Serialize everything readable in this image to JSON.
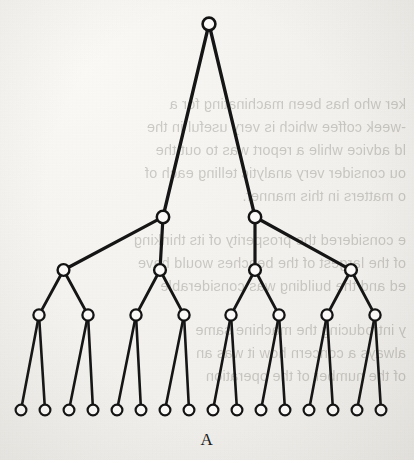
{
  "figure": {
    "caption": "A",
    "kind": "complete-binary-tree",
    "depth": 4,
    "node_counts_per_level": [
      1,
      2,
      4,
      8,
      16
    ],
    "total_nodes": 31,
    "total_edges": 30,
    "node_fill_color": "#fbfaf8",
    "node_stroke_color": "#141414",
    "edge_color": "#161616",
    "background_color": "#f3f2ef"
  },
  "geometry": {
    "width": 414,
    "height": 460,
    "levels": [
      {
        "level": 0,
        "y": 24,
        "radius": 6.4,
        "x": [
          209
        ]
      },
      {
        "level": 1,
        "y": 217,
        "radius": 6.2,
        "x": [
          163,
          255
        ]
      },
      {
        "level": 2,
        "y": 315,
        "radius": 5.6,
        "x": [
          39,
          88,
          136,
          184,
          231,
          279,
          327,
          375
        ]
      },
      {
        "level": 3,
        "y": 315,
        "radius": 5.6,
        "x": []
      },
      {
        "level": 4,
        "y": 410,
        "radius": 5.4,
        "x": [
          21,
          45,
          69,
          93,
          117,
          141,
          165,
          189,
          213,
          237,
          261,
          285,
          309,
          333,
          357,
          381
        ]
      }
    ]
  },
  "bleed_text": {
    "note": "faint mirrored show-through text from the reverse side of the scanned page",
    "lines": [
      {
        "top": 96,
        "text": "ker who has been machinating for a"
      },
      {
        "top": 119,
        "text": "-week coffee which is very useful in the"
      },
      {
        "top": 142,
        "text": "ld advice while a report was to out the"
      },
      {
        "top": 165,
        "text": "ou consider very analytic telling each of"
      },
      {
        "top": 188,
        "text": "o matters in this manner."
      },
      {
        "top": 232,
        "text": "e considered the prosperity of its thinking"
      },
      {
        "top": 255,
        "text": "of the largest of the benches would have"
      },
      {
        "top": 278,
        "text": "ed and the building was considerable"
      },
      {
        "top": 322,
        "text": "y introducing the machine same"
      },
      {
        "top": 345,
        "text": "always a concern how it was an"
      },
      {
        "top": 368,
        "text": "of the number of the operation"
      }
    ]
  }
}
